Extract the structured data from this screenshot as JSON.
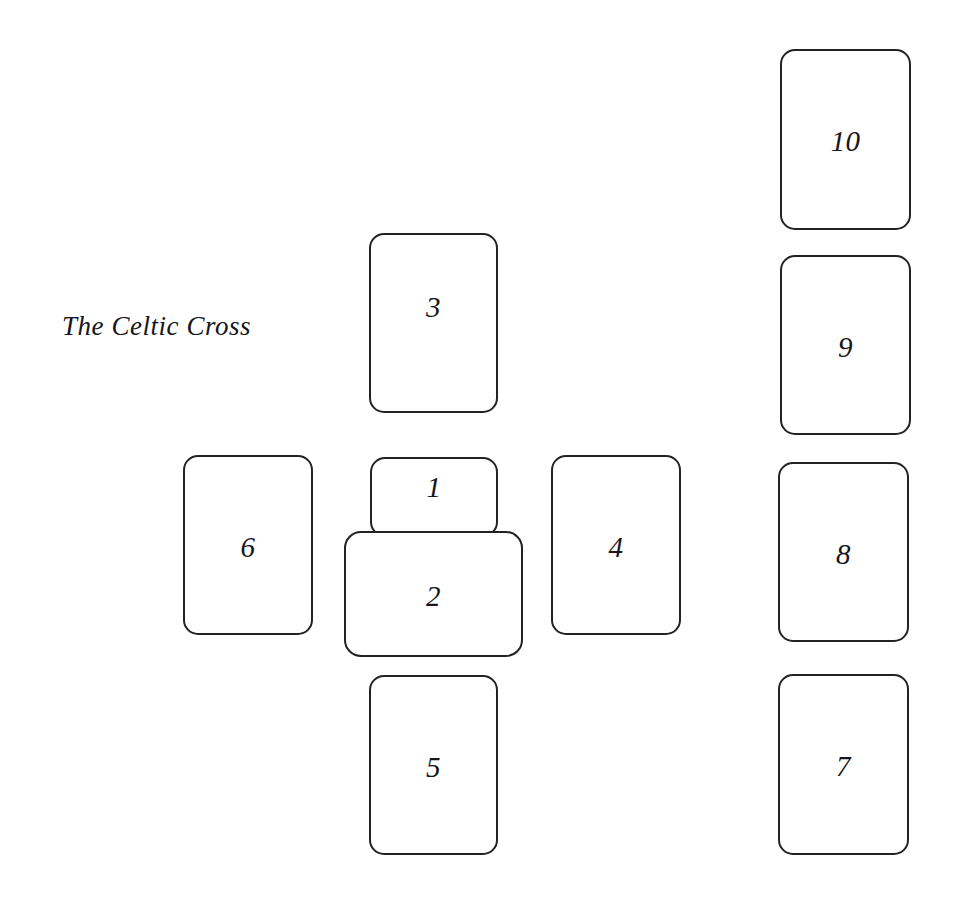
{
  "diagram": {
    "title": "The Celtic Cross",
    "title_position": {
      "x": 62,
      "y": 311
    },
    "title_font_size": 27,
    "background_color": "#ffffff",
    "card_border_color": "#232326",
    "card_fill_color": "#ffffff",
    "number_color": "#16161b",
    "canvas": {
      "width": 954,
      "height": 907
    }
  },
  "cards": [
    {
      "label": "1",
      "orientation": "portrait",
      "x": 370,
      "y": 457,
      "width": 128,
      "height": 80,
      "z": 2,
      "number_offset_y": -12,
      "role": "significator-present"
    },
    {
      "label": "2",
      "orientation": "landscape",
      "x": 344,
      "y": 531,
      "width": 179,
      "height": 126,
      "z": 3,
      "number_offset_y": 0,
      "role": "crossing-card"
    },
    {
      "label": "3",
      "orientation": "portrait",
      "x": 369,
      "y": 233,
      "width": 129,
      "height": 180,
      "z": 1,
      "number_offset_y": -18,
      "role": "above"
    },
    {
      "label": "4",
      "orientation": "portrait",
      "x": 551,
      "y": 455,
      "width": 130,
      "height": 180,
      "z": 1,
      "number_offset_y": 0,
      "role": "right"
    },
    {
      "label": "5",
      "orientation": "portrait",
      "x": 369,
      "y": 675,
      "width": 129,
      "height": 180,
      "z": 1,
      "number_offset_y": 0,
      "role": "below"
    },
    {
      "label": "6",
      "orientation": "portrait",
      "x": 183,
      "y": 455,
      "width": 130,
      "height": 180,
      "z": 1,
      "number_offset_y": 0,
      "role": "left"
    },
    {
      "label": "7",
      "orientation": "portrait",
      "x": 778,
      "y": 674,
      "width": 131,
      "height": 181,
      "z": 1,
      "number_offset_y": 0,
      "role": "staff-1"
    },
    {
      "label": "8",
      "orientation": "portrait",
      "x": 778,
      "y": 462,
      "width": 131,
      "height": 180,
      "z": 1,
      "number_offset_y": 0,
      "role": "staff-2"
    },
    {
      "label": "9",
      "orientation": "portrait",
      "x": 780,
      "y": 255,
      "width": 131,
      "height": 180,
      "z": 1,
      "number_offset_y": 0,
      "role": "staff-3"
    },
    {
      "label": "10",
      "orientation": "portrait",
      "x": 780,
      "y": 49,
      "width": 131,
      "height": 181,
      "z": 1,
      "number_offset_y": 0,
      "role": "staff-4"
    }
  ]
}
